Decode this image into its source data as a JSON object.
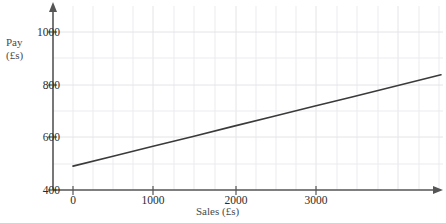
{
  "chart_data": {
    "type": "line",
    "title": "",
    "xlabel": "Sales (£s)",
    "ylabel_line1": "Pay",
    "ylabel_line2": "(£s)",
    "ylabel": "Pay (£s)",
    "xlim": [
      0,
      3500
    ],
    "ylim": [
      400,
      1050
    ],
    "xticks": [
      0,
      1000,
      2000,
      3000
    ],
    "xticklabels": [
      "0",
      "1000",
      "2000",
      "3000"
    ],
    "yticks": [
      400,
      600,
      800,
      1000
    ],
    "yticklabels": [
      "400",
      "600",
      "800",
      "1000"
    ],
    "grid": true,
    "grid_x_step": 250,
    "grid_y_step": 100,
    "legend": "none",
    "series": [
      {
        "name": "Pay vs Sales",
        "x": [
          0,
          500,
          1000,
          1500,
          2000,
          2500,
          3000,
          3500,
          4600
        ],
        "values": [
          490,
          527,
          565,
          602,
          640,
          677,
          715,
          752,
          835
        ],
        "color": "#3a3a3a"
      }
    ],
    "annotations": {
      "intercept": 490,
      "gradient_per_1000_sales": 75
    }
  },
  "axes": {
    "y_axis_color": "#555555",
    "x_axis_color": "#555555",
    "grid_color": "#e8e8ec",
    "line_color": "#3a3a3a",
    "label_color": "#4a4a4a",
    "tick_color": "#2b2b2b"
  }
}
